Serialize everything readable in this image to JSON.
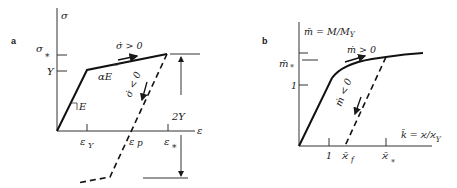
{
  "panel_a": {
    "label": "a",
    "y_axis": "σ",
    "x_axis": "ε",
    "sigma_star": "σ",
    "sigma_star_sub": "*",
    "yield": "Y",
    "modulus": "E",
    "hardening": "αE",
    "loading": "σ̇ > 0",
    "unloading": "σ̇ < 0",
    "range": "2Y",
    "eps_y": "ε",
    "eps_y_sub": "Y",
    "eps_p": "ε",
    "eps_p_sub": "p",
    "eps_star": "ε",
    "eps_star_sub": "*"
  },
  "panel_b": {
    "label": "b",
    "y_axis": "m̄ = M/M",
    "y_axis_sub": "Y",
    "x_axis": "k̄ = ϰ/ϰ",
    "x_axis_sub": "Y",
    "m_star": "m̄",
    "m_star_sub": "*",
    "y_tick_one": "1",
    "x_tick_one": "1",
    "loading": "ṁ > 0",
    "unloading": "ṁ < 0",
    "kappa_f": "ϰ̄",
    "kappa_f_sub": "f",
    "kappa_star": "ϰ̄",
    "kappa_star_sub": "*"
  }
}
